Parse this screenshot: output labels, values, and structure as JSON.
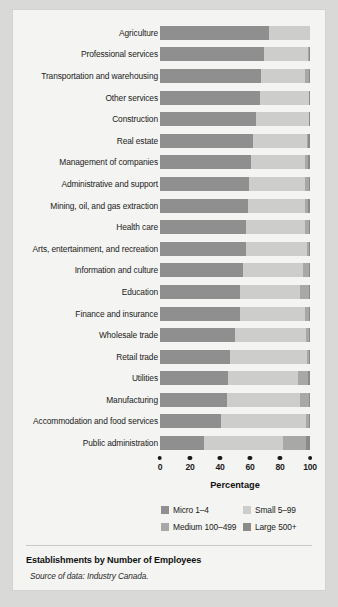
{
  "chart_data": {
    "type": "bar",
    "subtype": "stacked-horizontal-100",
    "title": "Establishments by Number of Employees",
    "xlabel": "Percentage",
    "ylabel": "",
    "xlim": [
      0,
      100
    ],
    "xticks": [
      0,
      20,
      40,
      60,
      80,
      100
    ],
    "grid": false,
    "legend_position": "below-axis",
    "source": "Source of data: Industry Canada.",
    "categories": [
      "Agriculture",
      "Professional services",
      "Transportation and warehousing",
      "Other services",
      "Construction",
      "Real estate",
      "Management of companies",
      "Administrative and support",
      "Mining, oil, and gas extraction",
      "Health care",
      "Arts, entertainment, and recreation",
      "Information and culture",
      "Education",
      "Finance and insurance",
      "Wholesale trade",
      "Retail trade",
      "Utilities",
      "Manufacturing",
      "Accommodation and food services",
      "Public administration"
    ],
    "series": [
      {
        "name": "Micro 1–4",
        "color": "#8f8f8f",
        "values": [
          72.5,
          69.0,
          67.5,
          66.5,
          64.0,
          62.0,
          60.5,
          59.5,
          58.5,
          57.5,
          57.0,
          55.0,
          53.5,
          53.0,
          50.0,
          46.5,
          45.0,
          44.5,
          40.5,
          29.0
        ]
      },
      {
        "name": "Small 5–99",
        "color": "#cdcdcb",
        "values": [
          27.5,
          29.7,
          29.0,
          32.8,
          35.3,
          36.3,
          36.0,
          37.0,
          38.3,
          39.0,
          41.0,
          40.0,
          40.0,
          43.5,
          47.5,
          51.7,
          47.0,
          49.0,
          56.8,
          53.0
        ]
      },
      {
        "name": "Medium 100–499",
        "color": "#a8a8a6",
        "values": [
          0.0,
          0.6,
          2.5,
          0.2,
          0.2,
          0.7,
          2.0,
          2.5,
          2.0,
          2.5,
          1.2,
          4.0,
          6.0,
          2.5,
          2.0,
          1.2,
          6.5,
          5.5,
          2.2,
          15.0
        ]
      },
      {
        "name": "Large 500+",
        "color": "#8a8a88",
        "values": [
          0.0,
          0.7,
          1.0,
          0.5,
          0.5,
          1.0,
          1.5,
          1.0,
          1.2,
          1.0,
          0.8,
          1.0,
          0.5,
          1.0,
          0.5,
          0.6,
          1.5,
          1.0,
          0.5,
          3.0
        ]
      }
    ]
  },
  "axis": {
    "title": "Percentage",
    "tick_labels": [
      "0",
      "20",
      "40",
      "60",
      "80",
      "100"
    ]
  },
  "legend": {
    "items": [
      {
        "label": "Micro 1–4",
        "swatch_class": "sw-micro"
      },
      {
        "label": "Small 5–99",
        "swatch_class": "sw-small"
      },
      {
        "label": "Medium 100–499",
        "swatch_class": "sw-medium"
      },
      {
        "label": "Large 500+",
        "swatch_class": "sw-large"
      }
    ]
  },
  "footer": {
    "caption": "Establishments by Number of Employees",
    "source": "Source of data: Industry Canada."
  }
}
